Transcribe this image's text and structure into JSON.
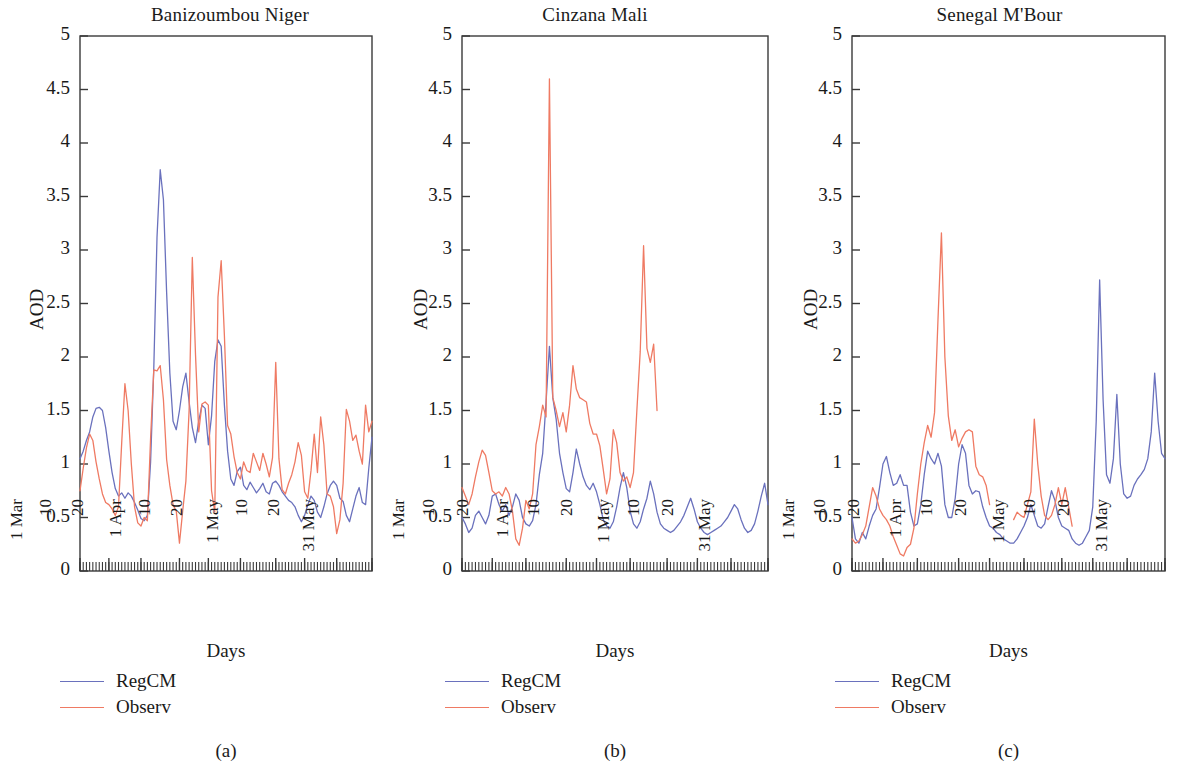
{
  "figure": {
    "background": "#ffffff",
    "series_colors": {
      "RegCM": "#6a71bd",
      "Observ": "#ef7a63"
    },
    "axis_color": "#3a3a3a"
  },
  "panels": [
    {
      "letter": "(a)",
      "title": "Banizoumbou Niger",
      "ylabel": "AOD",
      "xlabel": "Days",
      "legend": [
        {
          "label": "RegCM",
          "color": "#6a71bd"
        },
        {
          "label": "Observ",
          "color": "#ef7a63"
        }
      ],
      "yticks": [
        "0",
        "0.5",
        "1",
        "1.5",
        "2",
        "2.5",
        "3",
        "3.5",
        "4",
        "4.5",
        "5"
      ],
      "xticks": [
        "1 Mar",
        "10",
        "20",
        "1 Apr",
        "10",
        "20",
        "1 May",
        "10",
        "20",
        "31 May"
      ]
    },
    {
      "letter": "(b)",
      "title": "Cinzana Mali",
      "ylabel": "AOD",
      "xlabel": "Days",
      "legend": [
        {
          "label": "RegCM",
          "color": "#6a71bd"
        },
        {
          "label": "Observ",
          "color": "#ef7a63"
        }
      ],
      "yticks": [
        "0",
        "0.5",
        "1",
        "1.5",
        "2",
        "2.5",
        "3",
        "3.5",
        "4",
        "4.5",
        "5"
      ],
      "xticks": [
        "1 Mar",
        "10",
        "20",
        "1 Apr",
        "10",
        "20",
        "1 May",
        "10",
        "20",
        "31 May"
      ]
    },
    {
      "letter": "(c)",
      "title": "Senegal M'Bour",
      "ylabel": "AOD",
      "xlabel": "Days",
      "legend": [
        {
          "label": "RegCM",
          "color": "#6a71bd"
        },
        {
          "label": "Observ",
          "color": "#ef7a63"
        }
      ],
      "yticks": [
        "0",
        "0.5",
        "1",
        "1.5",
        "2",
        "2.5",
        "3",
        "3.5",
        "4",
        "4.5",
        "5"
      ],
      "xticks": [
        "1 Mar",
        "10",
        "20",
        "1 Apr",
        "10",
        "20",
        "1 May",
        "10",
        "20",
        "31 May"
      ]
    }
  ],
  "chart_data": [
    {
      "type": "line",
      "title": "Banizoumbou Niger",
      "xlabel": "Days",
      "ylabel": "AOD",
      "ylim": [
        0,
        5
      ],
      "ytick_values": [
        0,
        0.5,
        1,
        1.5,
        2,
        2.5,
        3,
        3.5,
        4,
        4.5,
        5
      ],
      "grid": false,
      "legend_position": "below-axes-left",
      "x_axis": {
        "start": "1 Mar",
        "end": "31 May",
        "n_days": 92,
        "tick_labels": [
          "1 Mar",
          "10",
          "20",
          "1 Apr",
          "10",
          "20",
          "1 May",
          "10",
          "20",
          "31 May"
        ],
        "tick_day_index": [
          0,
          9,
          19,
          31,
          40,
          50,
          61,
          70,
          80,
          91
        ]
      },
      "series": [
        {
          "name": "RegCM",
          "color": "#6a71bd",
          "values": [
            1.05,
            1.12,
            1.22,
            1.3,
            1.44,
            1.52,
            1.53,
            1.5,
            1.34,
            1.12,
            0.92,
            0.77,
            0.7,
            0.73,
            0.68,
            0.73,
            0.7,
            0.64,
            0.57,
            0.49,
            0.47,
            0.52,
            1.02,
            1.9,
            3.12,
            3.75,
            3.47,
            2.6,
            1.85,
            1.4,
            1.32,
            1.5,
            1.72,
            1.85,
            1.58,
            1.34,
            1.2,
            1.4,
            1.55,
            1.52,
            1.18,
            1.45,
            1.96,
            2.16,
            2.1,
            1.55,
            1.12,
            0.86,
            0.8,
            0.93,
            0.97,
            0.8,
            0.76,
            0.83,
            0.78,
            0.73,
            0.77,
            0.82,
            0.74,
            0.72,
            0.82,
            0.84,
            0.8,
            0.74,
            0.7,
            0.66,
            0.64,
            0.6,
            0.52,
            0.46,
            0.52,
            0.62,
            0.7,
            0.66,
            0.55,
            0.5,
            0.6,
            0.72,
            0.8,
            0.84,
            0.8,
            0.68,
            0.65,
            0.52,
            0.46,
            0.58,
            0.7,
            0.78,
            0.64,
            0.62,
            0.96,
            1.25
          ]
        },
        {
          "name": "Observ",
          "color": "#ef7a63",
          "values": [
            0.75,
            0.96,
            1.15,
            1.28,
            1.22,
            1.02,
            0.86,
            0.72,
            0.64,
            0.62,
            0.58,
            0.52,
            0.6,
            1.2,
            1.75,
            1.5,
            1.0,
            0.6,
            0.45,
            0.42,
            0.5,
            0.47,
            1.24,
            1.88,
            1.87,
            1.92,
            1.6,
            1.04,
            0.8,
            0.62,
            0.56,
            0.26,
            0.56,
            0.84,
            1.5,
            2.93,
            2.02,
            1.3,
            1.56,
            1.58,
            1.55,
            0.75,
            0.55,
            2.56,
            2.9,
            2.2,
            1.36,
            1.28,
            1.07,
            0.92,
            0.86,
            1.02,
            0.94,
            0.92,
            1.1,
            1.02,
            0.94,
            1.1,
            1.0,
            0.88,
            1.06,
            1.95,
            1.05,
            0.76,
            0.72,
            0.82,
            0.9,
            1.02,
            1.2,
            1.08,
            0.74,
            0.68,
            0.94,
            1.28,
            0.92,
            1.44,
            1.18,
            0.72,
            0.7,
            0.6,
            0.35,
            0.48,
            0.82,
            1.51,
            1.4,
            1.22,
            1.27,
            1.12,
            1.0,
            1.55,
            1.3,
            1.4
          ]
        }
      ]
    },
    {
      "type": "line",
      "title": "Cinzana Mali",
      "xlabel": "Days",
      "ylabel": "AOD",
      "ylim": [
        0,
        5
      ],
      "ytick_values": [
        0,
        0.5,
        1,
        1.5,
        2,
        2.5,
        3,
        3.5,
        4,
        4.5,
        5
      ],
      "grid": false,
      "legend_position": "below-axes-left",
      "x_axis": {
        "start": "1 Mar",
        "end": "31 May",
        "n_days": 92,
        "tick_labels": [
          "1 Mar",
          "10",
          "20",
          "1 Apr",
          "10",
          "20",
          "1 May",
          "10",
          "20",
          "31 May"
        ],
        "tick_day_index": [
          0,
          9,
          19,
          31,
          40,
          50,
          61,
          70,
          80,
          91
        ]
      },
      "series": [
        {
          "name": "RegCM",
          "color": "#6a71bd",
          "values": [
            0.5,
            0.44,
            0.36,
            0.4,
            0.52,
            0.56,
            0.5,
            0.44,
            0.52,
            0.7,
            0.72,
            0.62,
            0.56,
            0.62,
            0.52,
            0.6,
            0.72,
            0.66,
            0.5,
            0.44,
            0.42,
            0.47,
            0.62,
            0.9,
            1.1,
            1.58,
            2.1,
            1.62,
            1.42,
            1.1,
            0.92,
            0.77,
            0.74,
            0.92,
            1.14,
            1.0,
            0.88,
            0.8,
            0.76,
            0.82,
            0.74,
            0.62,
            0.48,
            0.42,
            0.4,
            0.46,
            0.6,
            0.78,
            0.92,
            0.78,
            0.56,
            0.44,
            0.4,
            0.46,
            0.58,
            0.68,
            0.84,
            0.72,
            0.55,
            0.44,
            0.4,
            0.38,
            0.36,
            0.38,
            0.42,
            0.46,
            0.52,
            0.6,
            0.68,
            0.58,
            0.46,
            0.4,
            0.36,
            0.34,
            0.36,
            0.38,
            0.4,
            0.42,
            0.46,
            0.5,
            0.56,
            0.62,
            0.58,
            0.48,
            0.4,
            0.36,
            0.38,
            0.44,
            0.56,
            0.7,
            0.82,
            0.62
          ]
        },
        {
          "name": "Observ",
          "color": "#ef7a63",
          "values": [
            0.78,
            0.7,
            0.62,
            0.72,
            0.88,
            1.02,
            1.13,
            1.08,
            0.92,
            0.75,
            0.72,
            0.74,
            0.7,
            0.78,
            0.72,
            0.56,
            0.3,
            0.24,
            0.4,
            0.66,
            0.58,
            0.72,
            1.18,
            1.35,
            1.55,
            1.44,
            4.6,
            1.62,
            1.5,
            1.35,
            1.48,
            1.3,
            1.55,
            1.92,
            1.7,
            1.62,
            1.6,
            1.58,
            1.38,
            1.28,
            1.28,
            1.17,
            0.95,
            0.72,
            0.86,
            1.32,
            1.2,
            0.92,
            0.84,
            0.88,
            0.78,
            0.92,
            1.5,
            2.05,
            3.04,
            2.08,
            1.95,
            2.12,
            1.5,
            null,
            null,
            null,
            null,
            null,
            null,
            null,
            null,
            null,
            null,
            null,
            null,
            null,
            null,
            null,
            null,
            null,
            null,
            null,
            null,
            null,
            null,
            null,
            null,
            null,
            null,
            null,
            null,
            null,
            null,
            null,
            null,
            null
          ]
        }
      ]
    },
    {
      "type": "line",
      "title": "Senegal M'Bour",
      "xlabel": "Days",
      "ylabel": "AOD",
      "ylim": [
        0,
        5
      ],
      "ytick_values": [
        0,
        0.5,
        1,
        1.5,
        2,
        2.5,
        3,
        3.5,
        4,
        4.5,
        5
      ],
      "grid": false,
      "legend_position": "below-axes-left",
      "x_axis": {
        "start": "1 Mar",
        "end": "31 May",
        "n_days": 92,
        "tick_labels": [
          "1 Mar",
          "10",
          "20",
          "1 Apr",
          "10",
          "20",
          "1 May",
          "10",
          "20",
          "31 May"
        ],
        "tick_day_index": [
          0,
          9,
          19,
          31,
          40,
          50,
          61,
          70,
          80,
          91
        ]
      },
      "series": [
        {
          "name": "RegCM",
          "color": "#6a71bd",
          "values": [
            0.5,
            0.3,
            0.26,
            0.36,
            0.3,
            0.42,
            0.52,
            0.58,
            0.78,
            1.0,
            1.07,
            0.92,
            0.8,
            0.82,
            0.9,
            0.8,
            0.8,
            0.55,
            0.42,
            0.44,
            0.62,
            0.9,
            1.12,
            1.05,
            1.0,
            1.1,
            0.98,
            0.62,
            0.5,
            0.5,
            0.68,
            1.0,
            1.18,
            1.1,
            0.8,
            0.72,
            0.75,
            0.74,
            0.6,
            0.5,
            0.42,
            0.4,
            0.36,
            0.34,
            0.3,
            0.28,
            0.26,
            0.26,
            0.3,
            0.36,
            0.42,
            0.5,
            0.62,
            0.52,
            0.42,
            0.4,
            0.44,
            0.6,
            0.75,
            0.66,
            0.5,
            0.42,
            0.4,
            0.38,
            0.3,
            0.26,
            0.24,
            0.26,
            0.32,
            0.38,
            0.6,
            1.4,
            2.72,
            1.6,
            0.9,
            0.82,
            1.05,
            1.65,
            1.0,
            0.72,
            0.68,
            0.7,
            0.8,
            0.86,
            0.9,
            0.95,
            1.05,
            1.3,
            1.85,
            1.4,
            1.1,
            1.05
          ]
        },
        {
          "name": "Observ",
          "color": "#ef7a63",
          "values": [
            0.3,
            0.26,
            0.28,
            0.34,
            0.42,
            0.6,
            0.78,
            0.7,
            0.58,
            0.52,
            0.48,
            0.42,
            0.32,
            0.24,
            0.16,
            0.14,
            0.22,
            0.25,
            0.4,
            0.72,
            1.0,
            1.2,
            1.36,
            1.25,
            1.48,
            2.35,
            3.16,
            2.0,
            1.45,
            1.22,
            1.32,
            1.16,
            1.24,
            1.3,
            1.32,
            1.3,
            0.98,
            0.9,
            0.88,
            0.8,
            0.62,
            null,
            null,
            null,
            null,
            null,
            null,
            0.48,
            0.55,
            0.52,
            0.5,
            0.62,
            0.74,
            1.42,
            1.0,
            0.7,
            0.52,
            0.48,
            0.52,
            0.62,
            0.78,
            0.62,
            0.78,
            0.6,
            0.42,
            null,
            null,
            null,
            null,
            null,
            null,
            null,
            null,
            null,
            null,
            null,
            null,
            null,
            null,
            null,
            null,
            null,
            null,
            null,
            null,
            null,
            null,
            null,
            null,
            null,
            null,
            null
          ]
        }
      ]
    }
  ]
}
